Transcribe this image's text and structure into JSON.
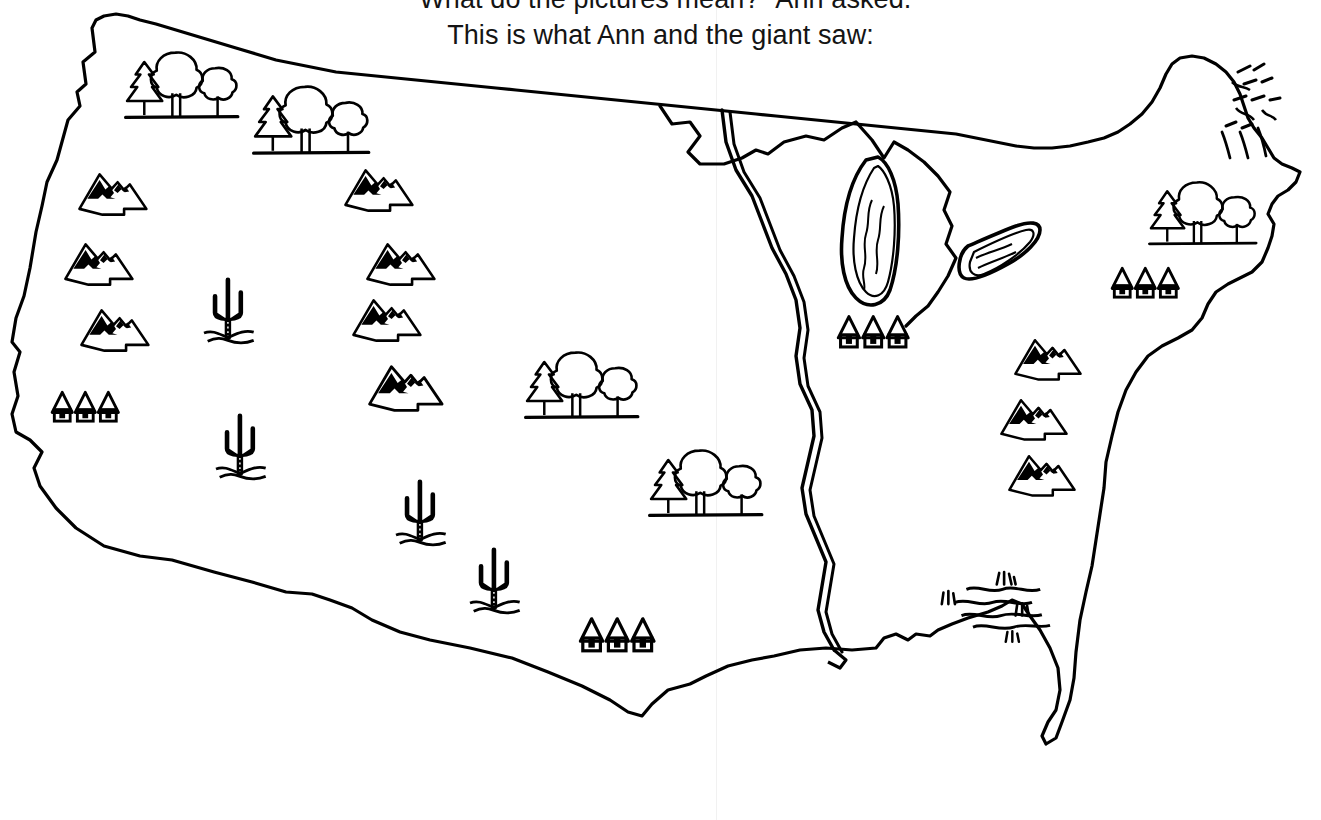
{
  "document": {
    "kind": "worksheet-page",
    "title": "This is what Ann and the giant saw:"
  },
  "story": {
    "line1": "\"What do the pictures mean?\" Ann asked.",
    "line2": "This is what Ann and the giant saw:"
  },
  "map": {
    "name": "United States outline map",
    "ink_color": "#000000",
    "paper_color": "#ffffff",
    "features": [
      {
        "id": "pacific-northwest-forest",
        "symbol": "trees",
        "region": "Pacific Northwest",
        "count": 1
      },
      {
        "id": "northern-rockies-forest",
        "symbol": "trees",
        "region": "Northern Rockies",
        "count": 1
      },
      {
        "id": "west-coast-mountains",
        "symbol": "mountains",
        "region": "Sierra Nevada / Cascades",
        "count": 3
      },
      {
        "id": "rocky-mountains",
        "symbol": "mountains",
        "region": "Rocky Mountains",
        "count": 4
      },
      {
        "id": "southwest-desert",
        "symbol": "cactus",
        "region": "Southwest Desert",
        "count": 4
      },
      {
        "id": "west-coast-cities",
        "symbol": "houses",
        "region": "California coast",
        "count": 3
      },
      {
        "id": "southern-plains-cities",
        "symbol": "houses",
        "region": "Southern Plains",
        "count": 3
      },
      {
        "id": "great-lakes-cities",
        "symbol": "houses",
        "region": "Great Lakes shore",
        "count": 3
      },
      {
        "id": "northeast-cities",
        "symbol": "houses",
        "region": "Mid-Atlantic coast",
        "count": 3
      },
      {
        "id": "central-plains-forest",
        "symbol": "trees",
        "region": "Central Plains",
        "count": 1
      },
      {
        "id": "ozark-forest",
        "symbol": "trees",
        "region": "Ozarks",
        "count": 1
      },
      {
        "id": "new-england-forest",
        "symbol": "trees",
        "region": "New England",
        "count": 1
      },
      {
        "id": "appalachian-mountains",
        "symbol": "mountains",
        "region": "Appalachian Mountains",
        "count": 3
      },
      {
        "id": "great-lakes",
        "symbol": "lakes",
        "region": "Great Lakes",
        "count": 2
      },
      {
        "id": "mississippi-river",
        "symbol": "river",
        "region": "Mississippi River",
        "count": 1
      },
      {
        "id": "gulf-coast-swamp",
        "symbol": "swamp",
        "region": "Gulf Coast wetlands",
        "count": 1
      },
      {
        "id": "maine-highlands",
        "symbol": "hatching",
        "region": "Northern New England",
        "count": 1
      }
    ],
    "legend_symbols": [
      {
        "key": "mountains",
        "label": "mountains"
      },
      {
        "key": "trees",
        "label": "forest"
      },
      {
        "key": "cactus",
        "label": "desert"
      },
      {
        "key": "houses",
        "label": "cities"
      },
      {
        "key": "river",
        "label": "river"
      },
      {
        "key": "lakes",
        "label": "lakes"
      },
      {
        "key": "swamp",
        "label": "swamp"
      }
    ]
  }
}
